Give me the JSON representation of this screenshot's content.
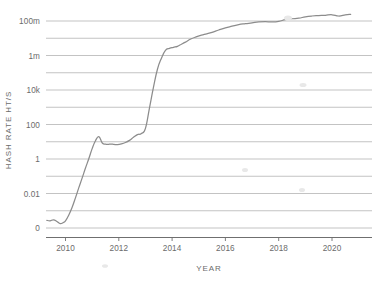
{
  "chart_data": {
    "type": "line",
    "title": "",
    "xlabel": "YEAR",
    "ylabel": "HASH RATE HT/S",
    "scale": "log",
    "grid": true,
    "legend": "none",
    "xlim": [
      2009.3,
      2020.8
    ],
    "ylim_exponents": [
      -4,
      9
    ],
    "x_ticks": [
      "2010",
      "2012",
      "2014",
      "2016",
      "2018",
      "2020"
    ],
    "x_tick_values": [
      2010,
      2012,
      2014,
      2016,
      2018,
      2020
    ],
    "y_ticks": [
      "100m",
      "1m",
      "10k",
      "100",
      "1",
      "0.01",
      "0"
    ],
    "y_tick_values": [
      100000000,
      1000000,
      10000,
      100,
      1,
      0.01,
      0.0001
    ],
    "y_minor_gridlines": [
      10000000,
      100000,
      1000,
      10,
      0.1,
      0.001
    ],
    "series": [
      {
        "name": "Hash rate",
        "color": "#8c8c8c",
        "x": [
          2009.3,
          2009.42,
          2009.55,
          2009.68,
          2009.8,
          2009.92,
          2010.0,
          2010.12,
          2010.25,
          2010.38,
          2010.5,
          2010.62,
          2010.75,
          2010.88,
          2011.0,
          2011.12,
          2011.25,
          2011.38,
          2011.5,
          2011.6,
          2011.7,
          2011.82,
          2011.95,
          2012.1,
          2012.25,
          2012.4,
          2012.55,
          2012.7,
          2012.85,
          2013.0,
          2013.15,
          2013.3,
          2013.45,
          2013.6,
          2013.75,
          2013.9,
          2014.05,
          2014.2,
          2014.35,
          2014.5,
          2014.7,
          2014.9,
          2015.1,
          2015.3,
          2015.5,
          2015.75,
          2016.0,
          2016.25,
          2016.5,
          2016.75,
          2017.0,
          2017.25,
          2017.5,
          2017.75,
          2018.0,
          2018.25,
          2018.5,
          2018.75,
          2019.0,
          2019.25,
          2019.5,
          2019.75,
          2020.0,
          2020.25,
          2020.5,
          2020.7
        ],
        "y": [
          0.00028,
          0.00026,
          0.0003,
          0.00024,
          0.00018,
          0.00021,
          0.00026,
          0.00055,
          0.0016,
          0.006,
          0.022,
          0.075,
          0.3,
          1.1,
          4.0,
          11.0,
          20.0,
          8.5,
          7.2,
          7.0,
          7.4,
          7.0,
          6.8,
          7.5,
          9.0,
          12.0,
          18.0,
          26.0,
          30.0,
          60.0,
          900.0,
          14000.0,
          160000.0,
          700000.0,
          2000000.0,
          2600000.0,
          3000000.0,
          3400000.0,
          4500000.0,
          6000000.0,
          9000000.0,
          12000000.0,
          15000000.0,
          18000000.0,
          22000000.0,
          30000000.0,
          40000000.0,
          50000000.0,
          62000000.0,
          70000000.0,
          78000000.0,
          88000000.0,
          92000000.0,
          88000000.0,
          95000000.0,
          120000000.0,
          135000000.0,
          145000000.0,
          175000000.0,
          195000000.0,
          205000000.0,
          215000000.0,
          230000000.0,
          195000000.0,
          225000000.0,
          245000000.0
        ]
      }
    ]
  },
  "axes": {
    "y_axis_title": "HASH RATE HT/S",
    "x_axis_title": "YEAR"
  },
  "colors": {
    "line": "#8c8c8c",
    "grid": "#9a9a9a",
    "axis": "#6f6f6f",
    "text": "#6b6b6b",
    "background": "#ffffff"
  }
}
